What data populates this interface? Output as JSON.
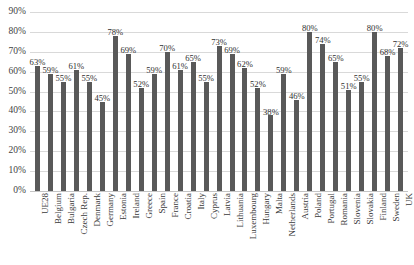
{
  "chart_data": {
    "type": "bar",
    "title": "",
    "subtitle": "",
    "xlabel": "",
    "ylabel": "",
    "ylim": [
      0,
      0.9
    ],
    "grid": true,
    "legend": false,
    "legend_position": "none",
    "bar_color": "#595959",
    "gridline_color": "#d9d9d9",
    "value_format": "percent",
    "y_ticks": [
      "0%",
      "10%",
      "20%",
      "30%",
      "40%",
      "50%",
      "60%",
      "70%",
      "80%",
      "90%"
    ],
    "y_tick_values": [
      0,
      10,
      20,
      30,
      40,
      50,
      60,
      70,
      80,
      90
    ],
    "categories": [
      "UE28",
      "Belgium",
      "Bulgaria",
      "Czech Rep.",
      "Denmark",
      "Germany",
      "Estonia",
      "Ireland",
      "Greece",
      "Spain",
      "France",
      "Croatia",
      "Italy",
      "Cyprus",
      "Latvia",
      "Lithuania",
      "Luxembourg",
      "Hungary",
      "Malta",
      "Netherlands",
      "Austria",
      "Poland",
      "Portugal",
      "Romania",
      "Slovenia",
      "Slovakia",
      "Finland",
      "Sweden",
      "UK"
    ],
    "values": [
      63,
      59,
      55,
      61,
      55,
      45,
      78,
      69,
      52,
      59,
      70,
      61,
      65,
      55,
      73,
      69,
      62,
      52,
      38,
      59,
      46,
      80,
      74,
      65,
      51,
      55,
      80,
      68,
      72
    ],
    "data_labels": [
      "63%",
      "59%",
      "55%",
      "61%",
      "55%",
      "45%",
      "78%",
      "69%",
      "52%",
      "59%",
      "70%",
      "61%",
      "65%",
      "55%",
      "73%",
      "69%",
      "62%",
      "52%",
      "38%",
      "59%",
      "46%",
      "80%",
      "74%",
      "65%",
      "51%",
      "55%",
      "80%",
      "68%",
      "72%"
    ]
  }
}
